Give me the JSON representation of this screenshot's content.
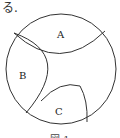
{
  "lead_text": "る.",
  "regions": [
    {
      "label": "A"
    },
    {
      "label": "B"
    },
    {
      "label": "C"
    }
  ],
  "caption": "図 1"
}
